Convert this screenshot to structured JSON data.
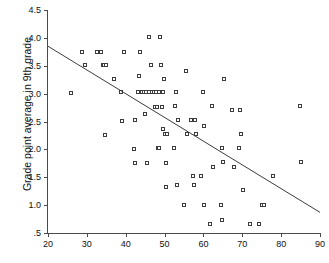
{
  "chart_data": {
    "type": "scatter",
    "title": "",
    "xlabel": "",
    "ylabel": "Grade point average in 9th grade",
    "xlim": [
      20,
      90
    ],
    "ylim": [
      0.5,
      4.5
    ],
    "grid": false,
    "legend": null,
    "xticks": [
      "20",
      "30",
      "40",
      "50",
      "60",
      "70",
      "80",
      "90"
    ],
    "xtick_values": [
      20,
      30,
      40,
      50,
      60,
      70,
      80,
      90
    ],
    "yticks": [
      "4.5",
      "4.0",
      "3.5",
      "3.0",
      "2.5",
      "2.0",
      "1.5",
      "1.0",
      ".5"
    ],
    "ytick_values": [
      4.5,
      4.0,
      3.5,
      3.0,
      2.5,
      2.0,
      1.5,
      1.0,
      0.5
    ],
    "marker": "open-square",
    "marker_color": "#3c3c3c",
    "series": [
      {
        "name": "students",
        "points": [
          [
            26.0,
            3.0
          ],
          [
            29.0,
            3.74
          ],
          [
            29.6,
            3.51
          ],
          [
            32.8,
            3.74
          ],
          [
            33.8,
            3.74
          ],
          [
            34.2,
            3.51
          ],
          [
            34.6,
            3.51
          ],
          [
            35.0,
            3.51
          ],
          [
            34.8,
            2.25
          ],
          [
            37.2,
            3.26
          ],
          [
            39.0,
            3.02
          ],
          [
            39.8,
            3.74
          ],
          [
            39.2,
            2.5
          ],
          [
            42.4,
            2.51
          ],
          [
            42.2,
            2.0
          ],
          [
            42.6,
            1.75
          ],
          [
            43.6,
            3.3
          ],
          [
            43.8,
            3.74
          ],
          [
            43.4,
            3.02
          ],
          [
            44.2,
            3.02
          ],
          [
            44.8,
            3.02
          ],
          [
            45.4,
            3.02
          ],
          [
            45.2,
            2.62
          ],
          [
            45.6,
            1.75
          ],
          [
            46.0,
            3.02
          ],
          [
            46.2,
            4.01
          ],
          [
            46.6,
            3.51
          ],
          [
            46.8,
            3.02
          ],
          [
            47.4,
            3.02
          ],
          [
            47.6,
            2.76
          ],
          [
            48.0,
            3.02
          ],
          [
            48.2,
            2.76
          ],
          [
            48.4,
            2.02
          ],
          [
            48.6,
            3.02
          ],
          [
            48.8,
            2.02
          ],
          [
            49.0,
            4.01
          ],
          [
            49.2,
            3.51
          ],
          [
            49.4,
            2.75
          ],
          [
            49.6,
            3.02
          ],
          [
            49.8,
            2.35
          ],
          [
            50.0,
            3.26
          ],
          [
            50.2,
            2.27
          ],
          [
            50.4,
            1.75
          ],
          [
            50.6,
            1.31
          ],
          [
            50.8,
            2.27
          ],
          [
            52.6,
            2.02
          ],
          [
            52.8,
            2.77
          ],
          [
            53.0,
            3.02
          ],
          [
            53.4,
            1.35
          ],
          [
            53.6,
            2.51
          ],
          [
            55.0,
            1.0
          ],
          [
            55.6,
            3.4
          ],
          [
            56.0,
            2.27
          ],
          [
            57.0,
            2.51
          ],
          [
            57.4,
            1.52
          ],
          [
            57.6,
            1.35
          ],
          [
            58.0,
            2.51
          ],
          [
            58.2,
            2.27
          ],
          [
            59.4,
            1.52
          ],
          [
            60.0,
            3.02
          ],
          [
            60.2,
            2.41
          ],
          [
            60.4,
            1.0
          ],
          [
            61.8,
            0.65
          ],
          [
            62.4,
            2.77
          ],
          [
            62.6,
            1.68
          ],
          [
            64.6,
            1.0
          ],
          [
            64.8,
            0.73
          ],
          [
            65.0,
            2.02
          ],
          [
            65.2,
            1.76
          ],
          [
            65.4,
            3.26
          ],
          [
            67.6,
            2.69
          ],
          [
            68.0,
            1.68
          ],
          [
            69.2,
            2.02
          ],
          [
            69.6,
            2.69
          ],
          [
            69.8,
            2.27
          ],
          [
            70.2,
            1.27
          ],
          [
            72.0,
            0.65
          ],
          [
            74.4,
            0.65
          ],
          [
            75.2,
            1.0
          ],
          [
            75.8,
            1.0
          ],
          [
            78.0,
            1.52
          ],
          [
            85.0,
            2.77
          ],
          [
            85.2,
            1.76
          ]
        ]
      }
    ],
    "fit_line": {
      "name": "linear-regression",
      "x_start": 20,
      "y_start": 3.85,
      "x_end": 90,
      "y_end": 0.87,
      "color": "#3c3c3c"
    }
  }
}
